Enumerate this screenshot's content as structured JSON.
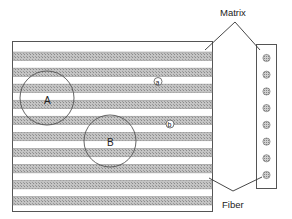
{
  "diagram": {
    "labels": {
      "matrix": "Matrix",
      "fiber": "Fiber",
      "region_a": "A",
      "region_b": "B",
      "point_a": "a",
      "point_b": "b"
    },
    "longitudinal_view": {
      "fiber_count": 10
    },
    "cross_section_view": {
      "fiber_count": 8
    },
    "colors": {
      "outline": "#444444",
      "fiber_fill": "#b8b8b8",
      "fiber_dot": "#8a8a8a",
      "matrix_fill": "#ffffff"
    }
  }
}
